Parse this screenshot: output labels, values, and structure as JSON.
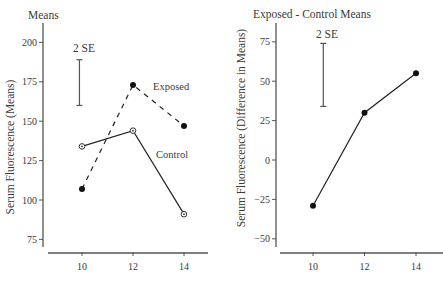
{
  "chart_data": [
    {
      "type": "line",
      "title": "Means",
      "xlabel": "",
      "ylabel": "Serum Fluorescence (Means)",
      "x": [
        10,
        12,
        14
      ],
      "xticks": [
        10,
        12,
        14
      ],
      "xtick_labels": [
        "10",
        "12",
        "14"
      ],
      "yticks": [
        75,
        100,
        125,
        150,
        175,
        200
      ],
      "ytick_labels": [
        "75",
        "100",
        "125",
        "150",
        "175",
        "200"
      ],
      "ylim": [
        70,
        210
      ],
      "grid": false,
      "legend": "inline labels",
      "series": [
        {
          "name": "Exposed",
          "values": [
            107,
            173,
            147
          ],
          "line_style": "dashed",
          "marker": "filled-circle"
        },
        {
          "name": "Control",
          "values": [
            134,
            144,
            91
          ],
          "line_style": "solid",
          "marker": "open-circle"
        }
      ],
      "annotations": [
        {
          "type": "error-bar",
          "text": "2 SE",
          "x_position": 9.9,
          "range": [
            160,
            189
          ]
        }
      ]
    },
    {
      "type": "line",
      "title": "Exposed - Control Means",
      "xlabel": "",
      "ylabel": "Serum Fluorescence (Difference in Means)",
      "x": [
        10,
        12,
        14
      ],
      "xticks": [
        10,
        12,
        14
      ],
      "xtick_labels": [
        "10",
        "12",
        "14"
      ],
      "yticks": [
        -50,
        -25,
        0,
        25,
        50,
        75
      ],
      "ytick_labels": [
        "−50",
        "−25",
        "0",
        "25",
        "50",
        "75"
      ],
      "ylim": [
        -55,
        85
      ],
      "grid": false,
      "series": [
        {
          "name": "Exposed - Control",
          "values": [
            -29,
            30,
            55
          ],
          "line_style": "solid",
          "marker": "filled-circle"
        }
      ],
      "annotations": [
        {
          "type": "error-bar",
          "text": "2 SE",
          "x_position": 10.4,
          "range": [
            34,
            74
          ]
        }
      ]
    }
  ]
}
